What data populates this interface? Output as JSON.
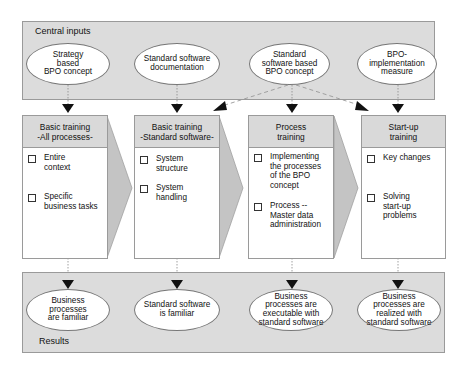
{
  "central_inputs": {
    "label": "Central inputs",
    "items": [
      {
        "text": "Strategy\nbased\nBPO concept"
      },
      {
        "text": "Standard software\ndocumentation"
      },
      {
        "text": "Standard\nsoftware based\nBPO concept"
      },
      {
        "text": "BPO-\nimplementation\nmeasure"
      }
    ]
  },
  "trainings": [
    {
      "title": "Basic training\n-All processes-",
      "items": [
        "Entire\ncontext",
        "Specific\nbusiness tasks"
      ]
    },
    {
      "title": "Basic training\n-Standard software-",
      "items": [
        "System\nstructure",
        "System\nhandling"
      ]
    },
    {
      "title": "Process\ntraining",
      "items": [
        "Implementing\nthe processes\nof the BPO\nconcept",
        "Process --\nMaster data\nadministration"
      ]
    },
    {
      "title": "Start-up\ntraining",
      "items": [
        "Key changes",
        "Solving\nstart-up\nproblems"
      ]
    }
  ],
  "results": {
    "label": "Results",
    "items": [
      {
        "text": "Business\nprocesses\nare familiar"
      },
      {
        "text": "Standard software\nis familiar"
      },
      {
        "text": "Business\nprocesses are\nexecutable with\nstandard software"
      },
      {
        "text": "Business\nprocesses are\nrealized with\nstandard software"
      }
    ]
  },
  "colors": {
    "panel_fill": "#dcdcdc",
    "header_fill": "#d9d9d9",
    "chevron_fill": "#c4c4c4",
    "border": "#9a9a9a",
    "arrow": "#111111"
  }
}
